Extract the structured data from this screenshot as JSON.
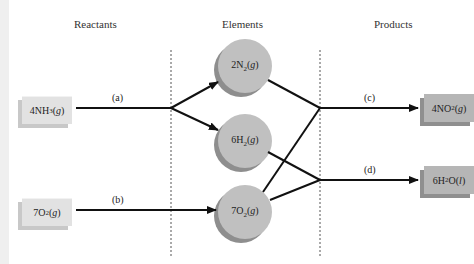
{
  "headings": {
    "reactants": "Reactants",
    "elements": "Elements",
    "products": "Products"
  },
  "reactants": [
    {
      "coef": "4NH",
      "sub": "3",
      "state": "g",
      "label": "4NH3(g)"
    },
    {
      "coef": "7O",
      "sub": "2",
      "state": "g",
      "label": "7O2(g)"
    }
  ],
  "elements": [
    {
      "coef": "2N",
      "sub": "2",
      "state": "g",
      "label": "2N2(g)"
    },
    {
      "coef": "6H",
      "sub": "2",
      "state": "g",
      "label": "6H2(g)"
    },
    {
      "coef": "7O",
      "sub": "2",
      "state": "g",
      "label": "7O2(g)"
    }
  ],
  "products": [
    {
      "coef": "4NO",
      "sub": "2",
      "state": "g",
      "tail": "",
      "label": "4NO2(g)"
    },
    {
      "coef": "6H",
      "sub": "2",
      "state": "l",
      "tail": "O",
      "label": "6H2O(l)"
    }
  ],
  "steps": {
    "a": "(a)",
    "b": "(b)",
    "c": "(c)",
    "d": "(d)"
  },
  "colors": {
    "reactant_box": "#e2e2e2",
    "product_box": "#b6b6b6",
    "circle": "#bdbdbd",
    "line": "#111111"
  }
}
